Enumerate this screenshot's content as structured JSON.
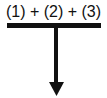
{
  "diagram": {
    "expression": "(1) + (2) + (3)",
    "line_color": "#111111",
    "arrow_direction": "down"
  }
}
